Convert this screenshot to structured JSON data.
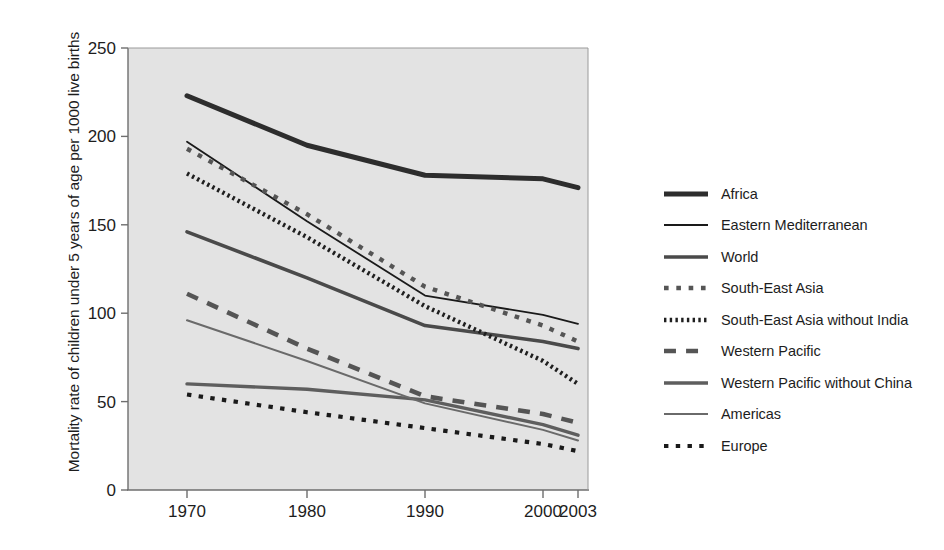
{
  "chart_data": {
    "type": "line",
    "title": "",
    "xlabel": "",
    "ylabel": "Mortality rate of children under 5 years of age per 1000 live births",
    "x": [
      1970,
      1980,
      1990,
      2000,
      2003
    ],
    "xticklabels": [
      "1970",
      "1980",
      "1990",
      "2000",
      "2003"
    ],
    "yticks": [
      0,
      50,
      100,
      150,
      200,
      250
    ],
    "yticklabels": [
      "0",
      "50",
      "100",
      "150",
      "200",
      "250"
    ],
    "xlim": [
      1967,
      2004
    ],
    "ylim": [
      0,
      250
    ],
    "grid": false,
    "legend_position": "right",
    "plot_background": "#e3e3e3",
    "series": [
      {
        "name": "Africa",
        "values": [
          223,
          195,
          178,
          176,
          171
        ],
        "color": "#2d2d2d",
        "style": "solid",
        "width": 5.0
      },
      {
        "name": "Eastern Mediterranean",
        "values": [
          197,
          152,
          110,
          99,
          94
        ],
        "color": "#1a1a1a",
        "style": "solid",
        "width": 1.8
      },
      {
        "name": "World",
        "values": [
          146,
          120,
          93,
          84,
          80
        ],
        "color": "#4a4a4a",
        "style": "solid",
        "width": 3.6
      },
      {
        "name": "South-East Asia",
        "values": [
          193,
          156,
          115,
          93,
          84
        ],
        "color": "#555555",
        "style": "dotted-square",
        "width": 4.4
      },
      {
        "name": "South-East Asia without India",
        "values": [
          179,
          143,
          104,
          73,
          60
        ],
        "color": "#1f1f1f",
        "style": "fine-dotted",
        "width": 4.4
      },
      {
        "name": "Western Pacific",
        "values": [
          111,
          80,
          53,
          43,
          38
        ],
        "color": "#555555",
        "style": "dashed",
        "width": 4.6
      },
      {
        "name": "Western Pacific without China",
        "values": [
          60,
          57,
          51,
          37,
          31
        ],
        "color": "#5e5e5e",
        "style": "solid",
        "width": 3.4
      },
      {
        "name": "Americas",
        "values": [
          96,
          73,
          49,
          34,
          28
        ],
        "color": "#6a6a6a",
        "style": "solid",
        "width": 2.0
      },
      {
        "name": "Europe",
        "values": [
          54,
          44,
          35,
          26,
          22
        ],
        "color": "#1a1a1a",
        "style": "dotted-square",
        "width": 4.2
      }
    ]
  },
  "legend": {
    "items": [
      {
        "label": "Africa"
      },
      {
        "label": "Eastern Mediterranean"
      },
      {
        "label": "World"
      },
      {
        "label": "South-East Asia"
      },
      {
        "label": "South-East Asia without India"
      },
      {
        "label": "Western Pacific"
      },
      {
        "label": "Western Pacific without China"
      },
      {
        "label": "Americas"
      },
      {
        "label": "Europe"
      }
    ]
  }
}
